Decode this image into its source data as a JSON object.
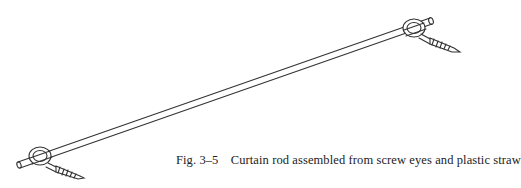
{
  "figure": {
    "label": "Fig. 3–5",
    "caption": "Curtain rod assembled from screw eyes and plastic straw",
    "illustration": "curtain-rod-with-screw-eyes"
  }
}
